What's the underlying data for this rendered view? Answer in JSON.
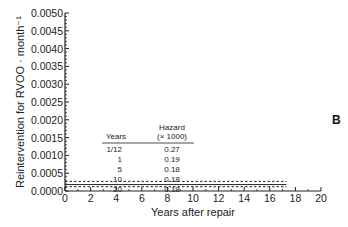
{
  "panel_label": "B",
  "chart_data": {
    "type": "line",
    "title": "",
    "xlabel": "Years after repair",
    "ylabel": "Reintervention for RVOO · month⁻¹",
    "xlim": [
      0,
      20
    ],
    "ylim": [
      0,
      0.005
    ],
    "x_ticks": [
      "0",
      "2",
      "4",
      "6",
      "8",
      "10",
      "12",
      "14",
      "16",
      "18",
      "20"
    ],
    "y_ticks": [
      "0.0000",
      "0.0005",
      "0.0010",
      "0.0015",
      "0.0020",
      "0.0025",
      "0.0030",
      "0.0035",
      "0.0040",
      "0.0045",
      "0.0050"
    ],
    "grid": false,
    "series": [
      {
        "name": "Hazard",
        "style": "solid",
        "x": [
          0,
          17.3
        ],
        "values": [
          0.00018,
          0.00018
        ]
      },
      {
        "name": "Upper CL",
        "style": "dashed",
        "x": [
          0,
          17.3
        ],
        "values": [
          0.00027,
          0.00027
        ]
      },
      {
        "name": "Lower CL",
        "style": "dashed",
        "x": [
          0,
          17.3
        ],
        "values": [
          0.00012,
          0.00012
        ]
      }
    ],
    "inset_table": {
      "headers": [
        "Years",
        "Hazard",
        "(× 1000)"
      ],
      "rows": [
        [
          "1/12",
          "0.27"
        ],
        [
          "1",
          "0.19"
        ],
        [
          "5",
          "0.18"
        ],
        [
          "10",
          "0.18"
        ],
        [
          "20",
          "0.18"
        ]
      ]
    }
  }
}
